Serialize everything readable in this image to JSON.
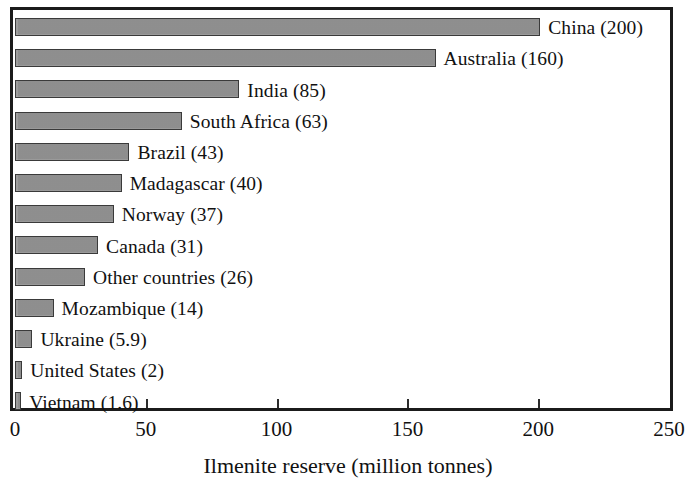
{
  "chart_data": {
    "type": "bar",
    "orientation": "horizontal",
    "title": "",
    "xlabel": "Ilmenite reserve (million tonnes)",
    "ylabel": "",
    "xlim": [
      0,
      250
    ],
    "xticks": [
      0,
      50,
      100,
      150,
      200,
      250
    ],
    "xtick_labels": [
      "0",
      "50",
      "100",
      "150",
      "200",
      "250"
    ],
    "grid": false,
    "legend": "none",
    "bar_color": "#949494",
    "bar_edge_color": "#3a3a3a",
    "frame_color": "#1b1b1b",
    "categories": [
      "China",
      "Australia",
      "India",
      "South Africa",
      "Brazil",
      "Madagascar",
      "Norway",
      "Canada",
      "Other countries",
      "Mozambique",
      "Ukraine",
      "United States",
      "Vietnam"
    ],
    "values": [
      200,
      160,
      85,
      63,
      43,
      40,
      37,
      31,
      26,
      14,
      5.9,
      2,
      1.6
    ],
    "data_labels": [
      "China (200)",
      "Australia (160)",
      "India (85)",
      "South Africa (63)",
      "Brazil (43)",
      "Madagascar (40)",
      "Norway (37)",
      "Canada (31)",
      "Other countries (26)",
      "Mozambique (14)",
      "Ukraine (5.9)",
      "United States (2)",
      "Vietnam (1.6)"
    ]
  }
}
